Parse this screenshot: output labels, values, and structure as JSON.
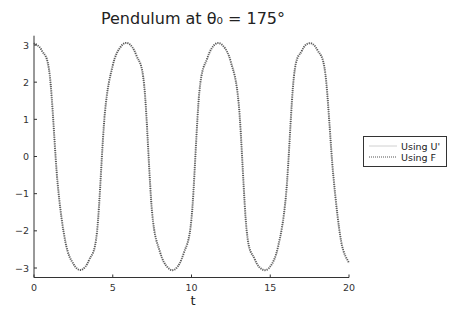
{
  "chart_data": {
    "type": "line",
    "title": "Pendulum at θ₀ = 175°",
    "xlabel": "t",
    "ylabel": "",
    "xlim": [
      0,
      20
    ],
    "ylim": [
      -3.25,
      3.25
    ],
    "xticks": [
      0,
      5,
      10,
      15,
      20
    ],
    "xtick_labels": [
      "0",
      "5",
      "10",
      "15",
      "20"
    ],
    "yticks": [
      3,
      2,
      1,
      0,
      -1,
      -2,
      -3
    ],
    "ytick_labels": [
      "3",
      "2",
      "1",
      "0",
      "−1",
      "−2",
      "−3"
    ],
    "grid": false,
    "legend_position": "right",
    "x": [
      0,
      0.5,
      1,
      1.5,
      2,
      2.5,
      3,
      3.5,
      4,
      4.5,
      5,
      5.5,
      6,
      6.5,
      7,
      7.5,
      8,
      8.5,
      9,
      9.5,
      10,
      10.5,
      11,
      11.5,
      12,
      12.5,
      13,
      13.5,
      14,
      14.5,
      15,
      15.5,
      16,
      16.5,
      17,
      17.5,
      18,
      18.5,
      19,
      19.5,
      20
    ],
    "series": [
      {
        "name": "Using U'",
        "style": "solid",
        "color": "#d0d0d0",
        "values": [
          3.05,
          2.85,
          2.19,
          -0.72,
          -2.31,
          -2.89,
          -3.05,
          -2.78,
          -2.03,
          1.17,
          2.45,
          2.95,
          3.04,
          2.72,
          1.9,
          -1.51,
          -2.57,
          -2.99,
          -3.02,
          -2.61,
          -1.67,
          1.74,
          2.64,
          3.02,
          2.98,
          2.54,
          1.41,
          -1.98,
          -2.75,
          -3.04,
          -2.96,
          -2.42,
          -1.04,
          2.14,
          2.84,
          3.05,
          2.86,
          2.22,
          -0.49,
          -2.28,
          -2.87
        ]
      },
      {
        "name": "Using F",
        "style": "dotted",
        "color": "#555555",
        "values": [
          3.05,
          2.85,
          2.19,
          -0.72,
          -2.31,
          -2.89,
          -3.05,
          -2.78,
          -2.03,
          1.17,
          2.45,
          2.95,
          3.04,
          2.72,
          1.9,
          -1.51,
          -2.57,
          -2.99,
          -3.02,
          -2.61,
          -1.67,
          1.74,
          2.64,
          3.02,
          2.98,
          2.54,
          1.41,
          -1.98,
          -2.75,
          -3.04,
          -2.96,
          -2.42,
          -1.04,
          2.14,
          2.84,
          3.05,
          2.86,
          2.22,
          -0.49,
          -2.28,
          -2.87
        ]
      }
    ]
  }
}
